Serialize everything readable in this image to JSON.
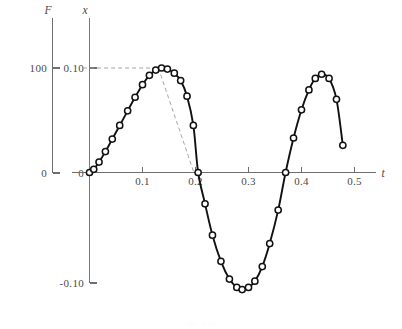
{
  "figure": {
    "caption": "Fig. 4-13"
  },
  "axes": {
    "secondary": {
      "name": "F",
      "ticks": [
        "100",
        "0"
      ]
    },
    "y": {
      "name": "x",
      "ticks": [
        "0.10",
        "0",
        "-0.10"
      ]
    },
    "x": {
      "name": "t",
      "ticks": [
        "0.1",
        "0.2",
        "0.3",
        "0.4",
        "0.5"
      ]
    }
  },
  "chart_data": {
    "type": "line",
    "title": "",
    "xlabel": "t",
    "ylabel": "x",
    "xlim": [
      -0.012,
      0.53
    ],
    "ylim": [
      -0.132,
      0.128
    ],
    "xticks": [
      0.1,
      0.2,
      0.3,
      0.4,
      0.5
    ],
    "xticklabels": [
      "0.1",
      "0.2",
      "0.3",
      "0.4",
      "0.5"
    ],
    "yticks": [
      0.1,
      0,
      -0.1
    ],
    "yticklabels": [
      "0.10",
      "0",
      "-0.10"
    ],
    "grid": false,
    "legend": null,
    "markers": "open-circle",
    "secondary_axis": {
      "name": "F",
      "ticks": [
        100,
        0
      ],
      "ticklabels": [
        "100",
        "0"
      ],
      "tick_positions_shared_with_y": [
        0.1,
        0.0
      ]
    },
    "series": [
      {
        "name": "x(t)",
        "x": [
          0.0,
          0.008,
          0.018,
          0.03,
          0.043,
          0.057,
          0.072,
          0.086,
          0.1,
          0.113,
          0.125,
          0.136,
          0.147,
          0.16,
          0.172,
          0.184,
          0.196,
          0.205,
          0.218,
          0.232,
          0.248,
          0.264,
          0.278,
          0.288,
          0.3,
          0.312,
          0.326,
          0.34,
          0.356,
          0.37,
          0.385,
          0.4,
          0.414,
          0.426,
          0.438,
          0.452,
          0.466,
          0.478
        ],
        "y": [
          0.0,
          0.003,
          0.01,
          0.02,
          0.032,
          0.045,
          0.059,
          0.072,
          0.084,
          0.093,
          0.098,
          0.1,
          0.099,
          0.095,
          0.088,
          0.073,
          0.045,
          0.0,
          -0.03,
          -0.06,
          -0.085,
          -0.102,
          -0.11,
          -0.112,
          -0.11,
          -0.104,
          -0.09,
          -0.068,
          -0.036,
          0.0,
          0.033,
          0.06,
          0.079,
          0.09,
          0.094,
          0.09,
          0.07,
          0.026
        ]
      }
    ],
    "annotations": [
      {
        "type": "dashed-horizontal",
        "from": [
          -0.012,
          0.1
        ],
        "to": [
          0.13,
          0.1
        ],
        "description": "horizontal construction line at x = 0.10"
      },
      {
        "type": "dashed-diagonal",
        "from": [
          0.13,
          0.1
        ],
        "to": [
          0.197,
          0.0
        ],
        "description": "diagonal construction line descending to the t axis near 0.2"
      }
    ]
  },
  "colors": {
    "curve": "#111111",
    "axis": "#6e6e6e",
    "guide": "#9a9a9a",
    "marker_fill": "#ffffff",
    "background": "#ffffff",
    "tick_text": "#4a4a4a"
  }
}
